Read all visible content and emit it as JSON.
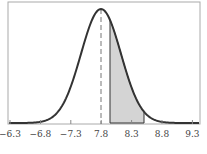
{
  "chart_data": {
    "type": "area",
    "title": "",
    "xlabel": "",
    "ylabel": "",
    "tick_labels": [
      "−6.3",
      "−6.8",
      "−7.3",
      "7.8",
      "8.3",
      "8.8",
      "9.3"
    ],
    "mean": 7.8,
    "shaded_region": {
      "from": 7.95,
      "to": 8.55
    },
    "grid": false,
    "legend": null,
    "colors": {
      "curve": "#333333",
      "shade": "#d4d4d4",
      "frame": "#999999",
      "mean_line": "#777777"
    }
  }
}
